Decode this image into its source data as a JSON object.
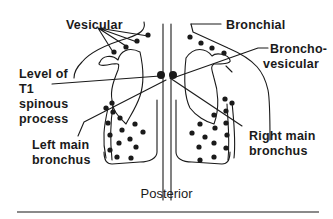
{
  "labels": {
    "vesicular": "Vesicular",
    "bronchial": "Bronchial",
    "bronchovesicular_line1": "Broncho-",
    "bronchovesicular_line2": "vesicular",
    "level_t1_line1": "Level of",
    "level_t1_line2": "T1",
    "level_t1_line3": "spinous",
    "level_t1_line4": "process",
    "left_main_line1": "Left main",
    "left_main_line2": "bronchus",
    "right_main_line1": "Right main",
    "right_main_line2": "bronchus",
    "caption": "Posterior"
  },
  "colors": {
    "ink": "#1a1a1a",
    "rule": "#8a8a8a",
    "background": "#ffffff"
  }
}
